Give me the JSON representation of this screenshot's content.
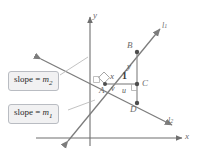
{
  "figure": {
    "kind": "geometry-diagram",
    "background_color": "#ffffff",
    "axis_color": "#6f6f6f",
    "line_color": "#7a7a7a",
    "callout_fill": "#f1f1f2",
    "callout_border": "#b9bcc2"
  },
  "axes": {
    "x_label": "x",
    "y_label": "y"
  },
  "lines": [
    {
      "id": "l1",
      "label": "l",
      "sub": "1"
    },
    {
      "id": "l2",
      "label": "l",
      "sub": "2"
    }
  ],
  "points": [
    {
      "id": "A",
      "label": "A"
    },
    {
      "id": "B",
      "label": "B"
    },
    {
      "id": "C",
      "label": "C"
    },
    {
      "id": "D",
      "label": "D"
    }
  ],
  "segment_labels": {
    "x": "x",
    "one": "1",
    "y": "y",
    "u": "u",
    "v": "v"
  },
  "callouts": [
    {
      "id": "m2",
      "text": "slope = ",
      "var": "m",
      "sub": "2"
    },
    {
      "id": "m1",
      "text": "slope = ",
      "var": "m",
      "sub": "1"
    }
  ]
}
